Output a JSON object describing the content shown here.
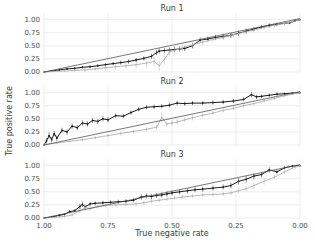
{
  "figure": {
    "xlabel": "True negative rate",
    "ylabel": "True positive rate",
    "xticks": [
      "1.00",
      "0.75",
      "0.50",
      "0.25",
      "0.00"
    ],
    "yticks": [
      "0.00",
      "0.25",
      "0.50",
      "0.75",
      "1.00"
    ],
    "panel_titles": [
      "Run 1",
      "Run 2",
      "Run 3"
    ],
    "colors": {
      "dark_series": "#1a1a1a",
      "light_series": "#b0b0b0",
      "grid": "#e8e8e8",
      "axis_text": "#4d4d4d",
      "background": "#ffffff"
    }
  },
  "chart_data": [
    {
      "type": "line",
      "title": "Run 1",
      "xlabel": "True negative rate",
      "ylabel": "True positive rate",
      "xlim": [
        1.0,
        0.0
      ],
      "ylim": [
        0.0,
        1.05
      ],
      "x_reversed": true,
      "grid": true,
      "xticks": [
        1.0,
        0.75,
        0.5,
        0.25,
        0.0
      ],
      "yticks": [
        0.0,
        0.25,
        0.5,
        0.75,
        1.0
      ],
      "series": [
        {
          "name": "dark",
          "color": "#1a1a1a",
          "x": [
            1.0,
            0.97,
            0.94,
            0.91,
            0.88,
            0.85,
            0.82,
            0.79,
            0.76,
            0.73,
            0.7,
            0.67,
            0.64,
            0.61,
            0.58,
            0.56,
            0.55,
            0.53,
            0.51,
            0.49,
            0.47,
            0.45,
            0.42,
            0.39,
            0.36,
            0.33,
            0.3,
            0.27,
            0.24,
            0.21,
            0.18,
            0.15,
            0.12,
            0.09,
            0.06,
            0.04,
            0.02,
            0.0
          ],
          "y": [
            0.0,
            0.02,
            0.04,
            0.06,
            0.07,
            0.09,
            0.1,
            0.12,
            0.14,
            0.16,
            0.18,
            0.2,
            0.23,
            0.26,
            0.3,
            0.37,
            0.4,
            0.41,
            0.42,
            0.43,
            0.44,
            0.45,
            0.5,
            0.61,
            0.63,
            0.66,
            0.68,
            0.7,
            0.74,
            0.78,
            0.82,
            0.86,
            0.89,
            0.91,
            0.93,
            0.94,
            0.98,
            1.0
          ],
          "yerr": [
            0.0,
            0.01,
            0.02,
            0.02,
            0.02,
            0.02,
            0.03,
            0.03,
            0.03,
            0.03,
            0.04,
            0.04,
            0.04,
            0.04,
            0.05,
            0.05,
            0.05,
            0.05,
            0.05,
            0.05,
            0.05,
            0.05,
            0.05,
            0.05,
            0.05,
            0.05,
            0.05,
            0.05,
            0.05,
            0.05,
            0.04,
            0.04,
            0.04,
            0.03,
            0.03,
            0.03,
            0.02,
            0.01
          ]
        },
        {
          "name": "light",
          "color": "#b0b0b0",
          "x": [
            1.0,
            0.96,
            0.92,
            0.88,
            0.84,
            0.8,
            0.76,
            0.72,
            0.68,
            0.64,
            0.6,
            0.57,
            0.55,
            0.53,
            0.51,
            0.49,
            0.46,
            0.42,
            0.38,
            0.34,
            0.3,
            0.26,
            0.22,
            0.18,
            0.14,
            0.1,
            0.06,
            0.03,
            0.0
          ],
          "y": [
            0.0,
            0.01,
            0.02,
            0.03,
            0.04,
            0.06,
            0.08,
            0.1,
            0.12,
            0.14,
            0.17,
            0.2,
            0.12,
            0.24,
            0.38,
            0.41,
            0.46,
            0.52,
            0.57,
            0.62,
            0.66,
            0.71,
            0.76,
            0.8,
            0.85,
            0.89,
            0.93,
            0.96,
            1.0
          ],
          "yerr": [
            0.0,
            0.02,
            0.03,
            0.03,
            0.04,
            0.04,
            0.05,
            0.05,
            0.06,
            0.06,
            0.07,
            0.08,
            0.1,
            0.1,
            0.09,
            0.08,
            0.07,
            0.06,
            0.06,
            0.05,
            0.05,
            0.05,
            0.04,
            0.04,
            0.04,
            0.03,
            0.03,
            0.02,
            0.01
          ]
        },
        {
          "name": "reference",
          "color": "#555555",
          "x": [
            1.0,
            0.0
          ],
          "y": [
            0.0,
            1.02
          ],
          "yerr": []
        }
      ]
    },
    {
      "type": "line",
      "title": "Run 2",
      "xlabel": "True negative rate",
      "ylabel": "True positive rate",
      "xlim": [
        1.0,
        0.0
      ],
      "ylim": [
        0.0,
        1.05
      ],
      "x_reversed": true,
      "grid": true,
      "xticks": [
        1.0,
        0.75,
        0.5,
        0.25,
        0.0
      ],
      "yticks": [
        0.0,
        0.25,
        0.5,
        0.75,
        1.0
      ],
      "series": [
        {
          "name": "dark",
          "color": "#1a1a1a",
          "x": [
            1.0,
            0.99,
            0.98,
            0.97,
            0.96,
            0.95,
            0.93,
            0.91,
            0.89,
            0.87,
            0.85,
            0.83,
            0.81,
            0.79,
            0.77,
            0.75,
            0.72,
            0.69,
            0.66,
            0.63,
            0.6,
            0.57,
            0.54,
            0.51,
            0.48,
            0.45,
            0.42,
            0.38,
            0.34,
            0.3,
            0.26,
            0.22,
            0.19,
            0.17,
            0.15,
            0.12,
            0.09,
            0.06,
            0.03,
            0.0
          ],
          "y": [
            0.0,
            0.08,
            0.18,
            0.1,
            0.22,
            0.13,
            0.28,
            0.25,
            0.36,
            0.33,
            0.42,
            0.4,
            0.47,
            0.45,
            0.5,
            0.48,
            0.56,
            0.55,
            0.62,
            0.68,
            0.72,
            0.73,
            0.74,
            0.76,
            0.8,
            0.79,
            0.8,
            0.8,
            0.81,
            0.82,
            0.84,
            0.87,
            0.96,
            0.92,
            0.93,
            0.95,
            0.97,
            0.98,
            0.99,
            1.0
          ],
          "yerr": [
            0.0,
            0.05,
            0.06,
            0.05,
            0.05,
            0.05,
            0.05,
            0.05,
            0.05,
            0.05,
            0.05,
            0.05,
            0.05,
            0.05,
            0.05,
            0.05,
            0.04,
            0.04,
            0.04,
            0.04,
            0.04,
            0.04,
            0.04,
            0.04,
            0.04,
            0.04,
            0.04,
            0.04,
            0.04,
            0.04,
            0.04,
            0.04,
            0.05,
            0.04,
            0.04,
            0.03,
            0.03,
            0.02,
            0.02,
            0.01
          ]
        },
        {
          "name": "light",
          "color": "#b0b0b0",
          "x": [
            1.0,
            0.95,
            0.9,
            0.85,
            0.8,
            0.75,
            0.7,
            0.65,
            0.6,
            0.56,
            0.54,
            0.52,
            0.5,
            0.48,
            0.45,
            0.42,
            0.38,
            0.34,
            0.3,
            0.26,
            0.22,
            0.18,
            0.14,
            0.1,
            0.06,
            0.03,
            0.0
          ],
          "y": [
            0.0,
            0.04,
            0.07,
            0.1,
            0.14,
            0.18,
            0.22,
            0.26,
            0.3,
            0.34,
            0.53,
            0.4,
            0.42,
            0.44,
            0.48,
            0.52,
            0.57,
            0.61,
            0.66,
            0.7,
            0.75,
            0.79,
            0.84,
            0.89,
            0.94,
            0.97,
            1.0
          ],
          "yerr": [
            0.0,
            0.02,
            0.02,
            0.03,
            0.03,
            0.03,
            0.04,
            0.04,
            0.04,
            0.05,
            0.09,
            0.05,
            0.05,
            0.05,
            0.05,
            0.05,
            0.05,
            0.04,
            0.04,
            0.04,
            0.04,
            0.03,
            0.03,
            0.03,
            0.02,
            0.02,
            0.01
          ]
        },
        {
          "name": "reference",
          "color": "#555555",
          "x": [
            1.0,
            0.0
          ],
          "y": [
            0.0,
            1.02
          ],
          "yerr": []
        }
      ]
    },
    {
      "type": "line",
      "title": "Run 3",
      "xlabel": "True negative rate",
      "ylabel": "True positive rate",
      "xlim": [
        1.0,
        0.0
      ],
      "ylim": [
        0.0,
        1.05
      ],
      "x_reversed": true,
      "grid": true,
      "xticks": [
        1.0,
        0.75,
        0.5,
        0.25,
        0.0
      ],
      "yticks": [
        0.0,
        0.25,
        0.5,
        0.75,
        1.0
      ],
      "series": [
        {
          "name": "dark",
          "color": "#1a1a1a",
          "x": [
            1.0,
            0.97,
            0.94,
            0.92,
            0.9,
            0.88,
            0.86,
            0.85,
            0.84,
            0.82,
            0.8,
            0.77,
            0.74,
            0.71,
            0.68,
            0.65,
            0.62,
            0.6,
            0.58,
            0.56,
            0.54,
            0.52,
            0.5,
            0.47,
            0.44,
            0.41,
            0.38,
            0.34,
            0.3,
            0.27,
            0.24,
            0.21,
            0.18,
            0.15,
            0.12,
            0.09,
            0.06,
            0.03,
            0.0
          ],
          "y": [
            0.0,
            0.02,
            0.05,
            0.07,
            0.12,
            0.14,
            0.22,
            0.26,
            0.21,
            0.27,
            0.28,
            0.29,
            0.3,
            0.31,
            0.32,
            0.34,
            0.4,
            0.42,
            0.41,
            0.43,
            0.44,
            0.46,
            0.48,
            0.5,
            0.52,
            0.54,
            0.55,
            0.57,
            0.59,
            0.62,
            0.7,
            0.74,
            0.8,
            0.83,
            0.92,
            0.88,
            0.96,
            0.99,
            1.0
          ],
          "yerr": [
            0.0,
            0.01,
            0.02,
            0.02,
            0.03,
            0.03,
            0.05,
            0.05,
            0.05,
            0.04,
            0.04,
            0.04,
            0.04,
            0.04,
            0.04,
            0.04,
            0.05,
            0.05,
            0.05,
            0.05,
            0.05,
            0.05,
            0.05,
            0.05,
            0.05,
            0.05,
            0.05,
            0.05,
            0.05,
            0.05,
            0.06,
            0.06,
            0.06,
            0.05,
            0.05,
            0.04,
            0.03,
            0.02,
            0.01
          ]
        },
        {
          "name": "light",
          "color": "#b0b0b0",
          "x": [
            1.0,
            0.96,
            0.92,
            0.89,
            0.86,
            0.84,
            0.82,
            0.79,
            0.76,
            0.72,
            0.68,
            0.64,
            0.61,
            0.58,
            0.55,
            0.52,
            0.49,
            0.46,
            0.42,
            0.38,
            0.34,
            0.3,
            0.27,
            0.24,
            0.21,
            0.18,
            0.14,
            0.1,
            0.06,
            0.03,
            0.0
          ],
          "y": [
            0.0,
            0.01,
            0.03,
            0.06,
            0.14,
            0.2,
            0.18,
            0.22,
            0.24,
            0.25,
            0.26,
            0.27,
            0.29,
            0.32,
            0.34,
            0.36,
            0.38,
            0.4,
            0.42,
            0.44,
            0.45,
            0.46,
            0.48,
            0.52,
            0.56,
            0.62,
            0.7,
            0.78,
            0.88,
            0.95,
            1.0
          ],
          "yerr": [
            0.0,
            0.01,
            0.02,
            0.03,
            0.05,
            0.06,
            0.05,
            0.04,
            0.04,
            0.04,
            0.04,
            0.04,
            0.04,
            0.04,
            0.04,
            0.04,
            0.04,
            0.04,
            0.04,
            0.04,
            0.04,
            0.04,
            0.04,
            0.05,
            0.05,
            0.06,
            0.06,
            0.05,
            0.04,
            0.02,
            0.01
          ]
        },
        {
          "name": "reference",
          "color": "#555555",
          "x": [
            1.0,
            0.0
          ],
          "y": [
            0.0,
            1.02
          ],
          "yerr": []
        }
      ]
    }
  ]
}
